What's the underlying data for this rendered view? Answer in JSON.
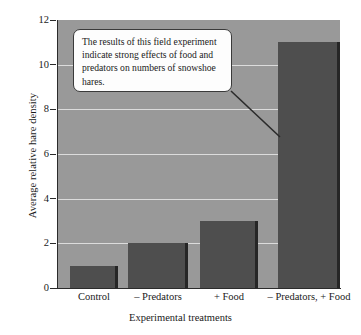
{
  "chart_data": {
    "type": "bar",
    "title": "",
    "xlabel": "Experimental treatments",
    "ylabel": "Average relative hare density",
    "categories": [
      "Control",
      "– Predators",
      "+ Food",
      "– Predators, + Food"
    ],
    "values": [
      1,
      2,
      3,
      11
    ],
    "ylim": [
      0,
      12
    ],
    "yticks": [
      0,
      2,
      4,
      6,
      8,
      10,
      12
    ],
    "ytick_labels": [
      "0",
      "2",
      "4",
      "6",
      "8",
      "10",
      "12"
    ],
    "gridlines": [
      2,
      4,
      6,
      8,
      10
    ],
    "grid": true,
    "legend": "none",
    "annotations": [
      {
        "text": "The results of this field experiment indicate strong effects of food and predators on numbers of snowshoe hares.",
        "points_to": "– Predators, + Food"
      }
    ],
    "colors": {
      "plot_background": "#999999",
      "bar_fill": "#4e4e4e",
      "bar_shadow": "#262626",
      "gridline": "#dcdcdc",
      "axis": "#2b2b2b",
      "callout_background": "#fdfdfd",
      "callout_border": "#3a3a3a",
      "text": "#1a1a1a"
    }
  }
}
